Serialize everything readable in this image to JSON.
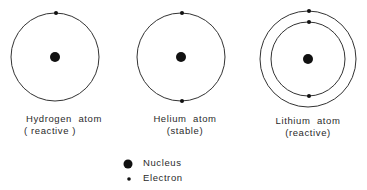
{
  "atoms": [
    {
      "name": "Hydrogen  atom",
      "property": "( reactive )",
      "shells": 1,
      "electrons": [
        1
      ]
    },
    {
      "name": "Helium  atom",
      "property": "(stable)",
      "shells": 1,
      "electrons": [
        2
      ]
    },
    {
      "name": "Lithium  atom",
      "property": "(reactive)",
      "shells": 2,
      "electrons": [
        2,
        1
      ]
    }
  ],
  "legend": {
    "nucleus_label": "Nucleus",
    "electron_label": "Electron"
  },
  "colors": {
    "line": "#333333",
    "fill": "#111111"
  }
}
